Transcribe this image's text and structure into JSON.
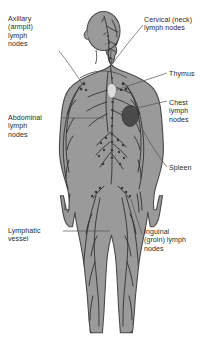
{
  "figure": {
    "colors": {
      "background": "#ffffff",
      "body_fill": "#9a9a9a",
      "body_outline": "#4a4a4a",
      "vessel": "#2a2a2a",
      "node": "#3a3a3a",
      "spleen": "#4a4a4a",
      "thymus": "#d9d9d9",
      "text": "#2b2b2b",
      "leader_line": "#555555"
    }
  },
  "labels": [
    {
      "id": "axillary",
      "text": "Axillary\n(armpit)\nlymph\nnodes",
      "side": "left",
      "target": "axillary-lymph-nodes"
    },
    {
      "id": "abdominal",
      "text": "Abdominal\nlymph\nnodes",
      "side": "left",
      "target": "abdominal-lymph-nodes"
    },
    {
      "id": "vessel",
      "text": "Lymphatic\nvessel",
      "side": "left",
      "target": "lymphatic-vessel"
    },
    {
      "id": "cervical",
      "text": "Cervical (neck)\nlymph nodes",
      "side": "right",
      "target": "cervical-lymph-nodes"
    },
    {
      "id": "thymus",
      "text": "Thymus",
      "side": "right",
      "target": "thymus-organ"
    },
    {
      "id": "chest",
      "text": "Chest\nlymph\nnodes",
      "side": "right",
      "target": "chest-lymph-nodes"
    },
    {
      "id": "spleen",
      "text": "Spleen",
      "side": "right",
      "target": "spleen-organ"
    },
    {
      "id": "inguinal",
      "text": "Inguinal\n(groin) lymph\nnodes",
      "side": "right",
      "target": "inguinal-lymph-nodes"
    }
  ]
}
